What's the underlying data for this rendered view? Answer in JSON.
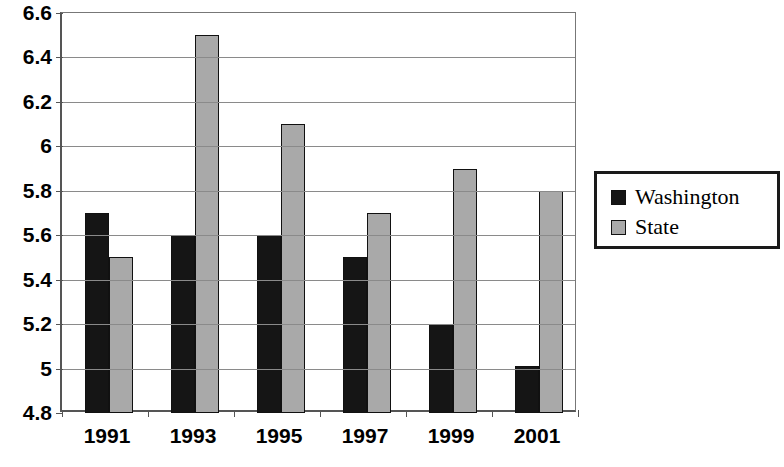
{
  "chart_data": {
    "type": "bar",
    "title": "",
    "subtitle": "",
    "xlabel": "",
    "ylabel": "",
    "categories": [
      "1991",
      "1993",
      "1995",
      "1997",
      "1999",
      "2001"
    ],
    "series": [
      {
        "name": "Washington",
        "color": "#151515",
        "values": [
          5.7,
          5.6,
          5.6,
          5.5,
          5.2,
          5.01
        ]
      },
      {
        "name": "State",
        "color": "#a9a9a9",
        "values": [
          5.5,
          6.5,
          6.1,
          5.7,
          5.9,
          5.8
        ]
      }
    ],
    "ylim": [
      4.8,
      6.6
    ],
    "ytick_labels": [
      "4.8",
      "5",
      "5.2",
      "5.4",
      "5.6",
      "5.8",
      "6",
      "6.2",
      "6.4",
      "6.6"
    ],
    "ytick_values": [
      4.8,
      5.0,
      5.2,
      5.4,
      5.6,
      5.8,
      6.0,
      6.2,
      6.4,
      6.6
    ],
    "grid": true,
    "legend_position": "right",
    "bar_border_color": "#111111",
    "gridline_color": "#8a8a8a",
    "axis_color": "#555555",
    "background": "#ffffff"
  }
}
